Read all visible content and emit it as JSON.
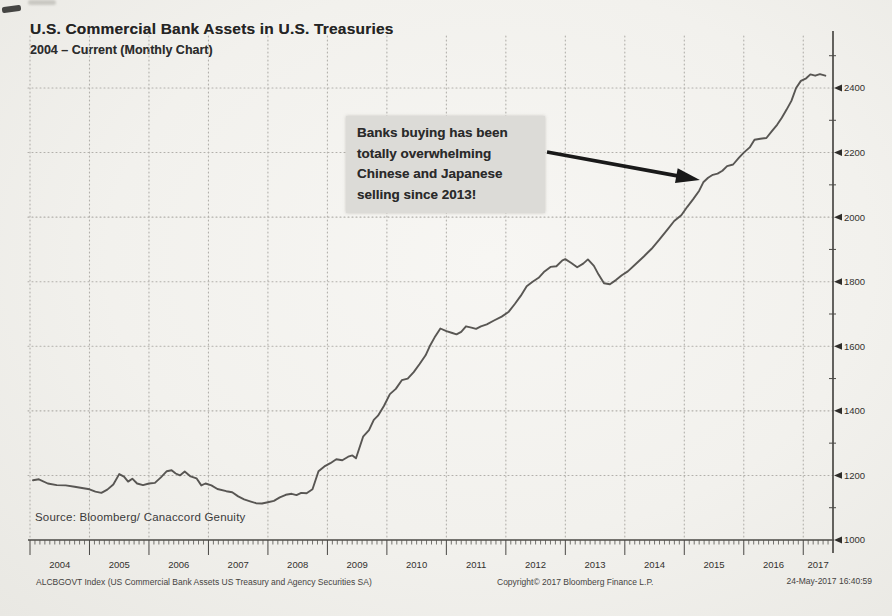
{
  "page": {
    "background_color": "#f2f1ed"
  },
  "header": {
    "title": "U.S. Commercial Bank Assets in U.S. Treasuries",
    "subtitle": "2004 – Current  (Monthly Chart)"
  },
  "annotation": {
    "text": "Banks buying has been\ntotally overwhelming\nChinese and Japanese\nselling since 2013!"
  },
  "source_label": "Source: Bloomberg/ Canaccord Genuity",
  "footer": {
    "ticker_label": "ALCBGOVT Index (US Commercial Bank Assets US Treasury and Agency Securities SA)",
    "copyright": "Copyright© 2017 Bloomberg Finance L.P.",
    "timestamp": "24-May-2017 16:40:59"
  },
  "chart_data": {
    "type": "line",
    "title": "U.S. Commercial Bank Assets in U.S. Treasuries",
    "subtitle": "2004 - Current (Monthly Chart)",
    "xlabel": "",
    "ylabel": "",
    "x_domain": [
      2004,
      2017.5
    ],
    "ylim": [
      1000,
      2450
    ],
    "y_ticks": [
      1000,
      1200,
      1400,
      1600,
      1800,
      2000,
      2200,
      2400
    ],
    "y_minor_tick_step": 100,
    "x_tick_years": [
      2004,
      2005,
      2006,
      2007,
      2008,
      2009,
      2010,
      2011,
      2012,
      2013,
      2014,
      2015,
      2016,
      2017
    ],
    "x_minor_ticks": "monthly",
    "grid": "dotted",
    "legend_position": "none",
    "line_color": "#4b4945",
    "annotation_arrow_target": [
      2015.33,
      2112
    ],
    "series": [
      {
        "name": "ALCBGOVT Index",
        "points": [
          [
            2004.05,
            1185
          ],
          [
            2004.15,
            1188
          ],
          [
            2004.3,
            1175
          ],
          [
            2004.45,
            1170
          ],
          [
            2004.6,
            1169
          ],
          [
            2004.75,
            1165
          ],
          [
            2004.9,
            1160
          ],
          [
            2005.0,
            1157
          ],
          [
            2005.1,
            1150
          ],
          [
            2005.2,
            1146
          ],
          [
            2005.3,
            1156
          ],
          [
            2005.4,
            1172
          ],
          [
            2005.5,
            1204
          ],
          [
            2005.58,
            1196
          ],
          [
            2005.65,
            1181
          ],
          [
            2005.72,
            1190
          ],
          [
            2005.8,
            1175
          ],
          [
            2005.9,
            1170
          ],
          [
            2006.0,
            1175
          ],
          [
            2006.1,
            1177
          ],
          [
            2006.2,
            1194
          ],
          [
            2006.3,
            1213
          ],
          [
            2006.38,
            1216
          ],
          [
            2006.45,
            1206
          ],
          [
            2006.52,
            1200
          ],
          [
            2006.6,
            1212
          ],
          [
            2006.7,
            1197
          ],
          [
            2006.8,
            1191
          ],
          [
            2006.88,
            1169
          ],
          [
            2006.95,
            1175
          ],
          [
            2007.05,
            1169
          ],
          [
            2007.15,
            1158
          ],
          [
            2007.3,
            1151
          ],
          [
            2007.4,
            1148
          ],
          [
            2007.5,
            1135
          ],
          [
            2007.6,
            1126
          ],
          [
            2007.7,
            1120
          ],
          [
            2007.8,
            1114
          ],
          [
            2007.9,
            1113
          ],
          [
            2008.0,
            1117
          ],
          [
            2008.1,
            1121
          ],
          [
            2008.2,
            1132
          ],
          [
            2008.3,
            1140
          ],
          [
            2008.4,
            1143
          ],
          [
            2008.48,
            1139
          ],
          [
            2008.56,
            1146
          ],
          [
            2008.65,
            1145
          ],
          [
            2008.75,
            1157
          ],
          [
            2008.85,
            1213
          ],
          [
            2008.95,
            1228
          ],
          [
            2009.05,
            1238
          ],
          [
            2009.15,
            1250
          ],
          [
            2009.25,
            1247
          ],
          [
            2009.35,
            1258
          ],
          [
            2009.42,
            1262
          ],
          [
            2009.48,
            1253
          ],
          [
            2009.6,
            1320
          ],
          [
            2009.7,
            1340
          ],
          [
            2009.78,
            1372
          ],
          [
            2009.85,
            1385
          ],
          [
            2009.95,
            1415
          ],
          [
            2010.05,
            1452
          ],
          [
            2010.15,
            1468
          ],
          [
            2010.25,
            1495
          ],
          [
            2010.35,
            1500
          ],
          [
            2010.45,
            1520
          ],
          [
            2010.55,
            1545
          ],
          [
            2010.65,
            1572
          ],
          [
            2010.72,
            1600
          ],
          [
            2010.8,
            1627
          ],
          [
            2010.9,
            1655
          ],
          [
            2011.0,
            1647
          ],
          [
            2011.1,
            1641
          ],
          [
            2011.17,
            1637
          ],
          [
            2011.25,
            1645
          ],
          [
            2011.33,
            1662
          ],
          [
            2011.42,
            1658
          ],
          [
            2011.5,
            1654
          ],
          [
            2011.58,
            1662
          ],
          [
            2011.68,
            1668
          ],
          [
            2011.8,
            1680
          ],
          [
            2011.93,
            1692
          ],
          [
            2012.05,
            1707
          ],
          [
            2012.15,
            1731
          ],
          [
            2012.25,
            1756
          ],
          [
            2012.35,
            1786
          ],
          [
            2012.45,
            1800
          ],
          [
            2012.55,
            1812
          ],
          [
            2012.65,
            1832
          ],
          [
            2012.75,
            1846
          ],
          [
            2012.85,
            1848
          ],
          [
            2012.95,
            1866
          ],
          [
            2013.0,
            1870
          ],
          [
            2013.1,
            1858
          ],
          [
            2013.2,
            1845
          ],
          [
            2013.3,
            1856
          ],
          [
            2013.38,
            1869
          ],
          [
            2013.48,
            1849
          ],
          [
            2013.56,
            1822
          ],
          [
            2013.65,
            1795
          ],
          [
            2013.75,
            1792
          ],
          [
            2013.85,
            1805
          ],
          [
            2013.95,
            1820
          ],
          [
            2014.05,
            1832
          ],
          [
            2014.18,
            1854
          ],
          [
            2014.32,
            1878
          ],
          [
            2014.45,
            1902
          ],
          [
            2014.58,
            1930
          ],
          [
            2014.72,
            1962
          ],
          [
            2014.83,
            1988
          ],
          [
            2014.95,
            2006
          ],
          [
            2015.05,
            2032
          ],
          [
            2015.15,
            2056
          ],
          [
            2015.25,
            2082
          ],
          [
            2015.32,
            2108
          ],
          [
            2015.4,
            2122
          ],
          [
            2015.48,
            2131
          ],
          [
            2015.56,
            2135
          ],
          [
            2015.64,
            2144
          ],
          [
            2015.72,
            2158
          ],
          [
            2015.82,
            2163
          ],
          [
            2015.92,
            2184
          ],
          [
            2016.0,
            2200
          ],
          [
            2016.1,
            2216
          ],
          [
            2016.18,
            2240
          ],
          [
            2016.28,
            2243
          ],
          [
            2016.38,
            2245
          ],
          [
            2016.48,
            2268
          ],
          [
            2016.56,
            2286
          ],
          [
            2016.64,
            2308
          ],
          [
            2016.72,
            2333
          ],
          [
            2016.8,
            2360
          ],
          [
            2016.88,
            2400
          ],
          [
            2016.96,
            2422
          ],
          [
            2017.05,
            2430
          ],
          [
            2017.12,
            2442
          ],
          [
            2017.2,
            2438
          ],
          [
            2017.28,
            2443
          ],
          [
            2017.37,
            2438
          ]
        ]
      }
    ]
  }
}
